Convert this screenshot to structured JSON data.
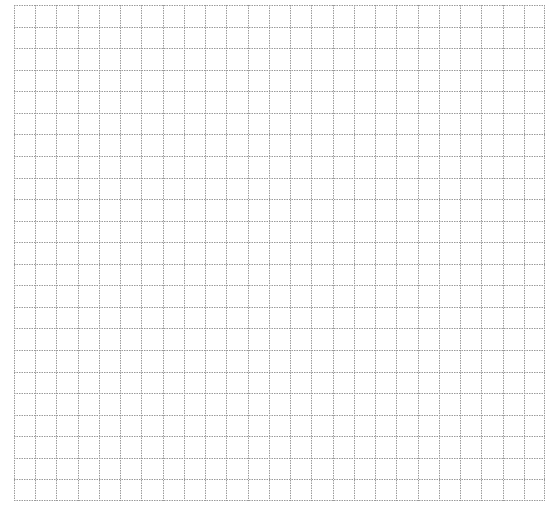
{
  "grid": {
    "columns": 25,
    "rows": 23,
    "line_color": "#9a9a9a",
    "background": "#ffffff",
    "line_style": "dotted"
  }
}
